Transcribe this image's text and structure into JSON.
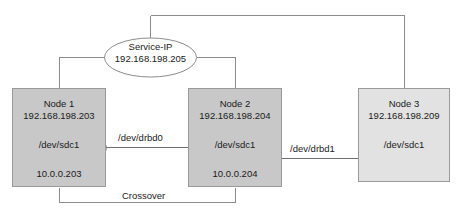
{
  "diagram": {
    "service_ip": {
      "name_label": "Service-IP",
      "address": "192.168.198.205"
    },
    "nodes": [
      {
        "id": "node-1",
        "title": "Node 1",
        "ip": "192.168.198.203",
        "device": "/dev/sdc1",
        "alt_ip": "10.0.0.203",
        "fill": "#c8c8c8"
      },
      {
        "id": "node-2",
        "title": "Node 2",
        "ip": "192.168.198.204",
        "device": "/dev/sdc1",
        "alt_ip": "10.0.0.204",
        "fill": "#c8c8c8"
      },
      {
        "id": "node-3",
        "title": "Node 3",
        "ip": "192.168.198.209",
        "device": "/dev/sdc1",
        "alt_ip": "",
        "fill": "#e2e2e2"
      }
    ],
    "edges": [
      {
        "id": "drbd0",
        "label": "/dev/drbd0"
      },
      {
        "id": "drbd1",
        "label": "/dev/drbd1"
      },
      {
        "id": "crossover",
        "label": "Crossover"
      }
    ],
    "colors": {
      "line": "#8c8c8c",
      "node_border": "#9a9a9a",
      "node_fill_primary": "#c8c8c8",
      "node_fill_secondary": "#e2e2e2",
      "text": "#1a1a1a",
      "background": "#ffffff"
    }
  }
}
